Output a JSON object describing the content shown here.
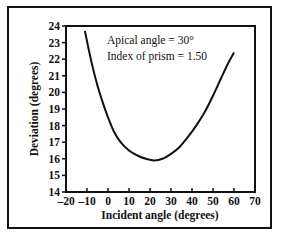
{
  "chart_data": {
    "type": "line",
    "title": "",
    "xlabel": "Incident angle (degrees)",
    "ylabel": "Deviation (degrees)",
    "xlim": [
      -20,
      70
    ],
    "ylim": [
      14,
      24
    ],
    "xticks": [
      "-20",
      "-10",
      "0",
      "10",
      "20",
      "30",
      "40",
      "50",
      "60",
      "70"
    ],
    "yticks": [
      "14",
      "15",
      "16",
      "17",
      "18",
      "19",
      "20",
      "21",
      "22",
      "23",
      "24"
    ],
    "grid": false,
    "legend": null,
    "annotations": [
      "Apical angle = 30°",
      "Index of prism = 1.50"
    ],
    "series": [
      {
        "name": "Deviation",
        "x": [
          -11,
          -8,
          -5,
          -2,
          0,
          3,
          6,
          10,
          14,
          18,
          22,
          26,
          30,
          34,
          38,
          42,
          46,
          50,
          54,
          57,
          60
        ],
        "y": [
          23.7,
          21.9,
          20.4,
          19.2,
          18.5,
          17.6,
          17.0,
          16.5,
          16.2,
          16.0,
          15.9,
          16.0,
          16.3,
          16.7,
          17.3,
          18.0,
          18.8,
          19.8,
          20.9,
          21.7,
          22.4
        ]
      }
    ]
  }
}
